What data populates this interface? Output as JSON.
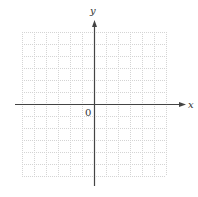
{
  "diagram": {
    "type": "coordinate-plane",
    "x_axis_label": "x",
    "y_axis_label": "y",
    "origin_label": "0",
    "grid": {
      "columns": 12,
      "rows": 12,
      "left": 22,
      "top": 32,
      "cell_size": 12,
      "line_color": "#d4d4d4",
      "line_style": "dotted"
    },
    "axes": {
      "color": "#444444",
      "origin_px": [
        94,
        104
      ],
      "x_axis_from": 15,
      "x_axis_to": 186,
      "y_axis_from": 20,
      "y_axis_to": 186
    }
  }
}
